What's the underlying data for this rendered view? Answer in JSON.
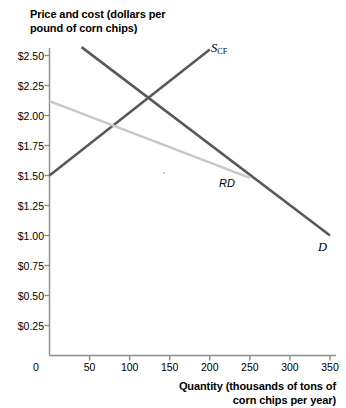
{
  "chart_data": {
    "type": "line",
    "title": "",
    "ylabel": "Price and cost (dollars per pound of corn chips)",
    "ylabel_line1": "Price and cost (dollars per",
    "ylabel_line2": "pound of corn chips)",
    "xlabel": "Quantity (thousands of tons of corn chips per year)",
    "xlabel_line1": "Quantity (thousands of tons of",
    "xlabel_line2": "corn chips per year)",
    "origin_label": "0",
    "xlim": [
      0,
      350
    ],
    "ylim": [
      0,
      2.5
    ],
    "grid": false,
    "legend_position": "inline-curve-labels",
    "x_ticks": [
      0,
      50,
      100,
      150,
      200,
      250,
      300,
      350
    ],
    "x_tick_labels": [
      "0",
      "50",
      "100",
      "150",
      "200",
      "250",
      "300",
      "350"
    ],
    "y_ticks": [
      0.25,
      0.5,
      0.75,
      1.0,
      1.25,
      1.5,
      1.75,
      2.0,
      2.25,
      2.5
    ],
    "y_tick_labels": [
      "$0.25",
      "$0.50",
      "$0.75",
      "$1.00",
      "$1.25",
      "$1.50",
      "$1.75",
      "$2.00",
      "$2.25",
      "$2.50"
    ],
    "series": [
      {
        "name": "D",
        "label": "D",
        "label_sub": "",
        "color": "#595959",
        "style": "solid",
        "width": 2.6,
        "points": [
          [
            40,
            2.57
          ],
          [
            350,
            1.0
          ]
        ]
      },
      {
        "name": "S_CF",
        "label": "S",
        "label_sub": "CF",
        "color": "#595959",
        "style": "solid",
        "width": 2.6,
        "points": [
          [
            0,
            1.5
          ],
          [
            200,
            2.55
          ]
        ]
      },
      {
        "name": "RD",
        "label": "RD",
        "label_sub": "",
        "color": "#c8c8c8",
        "style": "solid",
        "width": 2.6,
        "points": [
          [
            0,
            2.12
          ],
          [
            250,
            1.48
          ]
        ]
      }
    ],
    "annotations": [
      {
        "name": "equilibrium-intersection",
        "x": 150,
        "y": 2.2,
        "text": ""
      }
    ],
    "axis_color": "#8c8c8c"
  }
}
